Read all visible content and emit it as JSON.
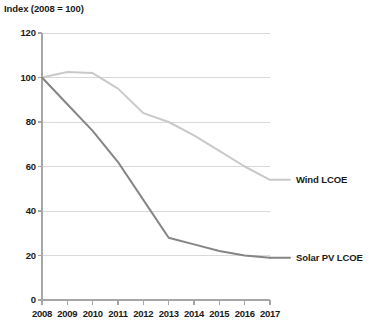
{
  "chart_data": {
    "type": "line",
    "title": "Index (2008 = 100)",
    "xlabel": "",
    "ylabel": "Index (2008 = 100)",
    "x": [
      2008,
      2009,
      2010,
      2011,
      2012,
      2013,
      2014,
      2015,
      2016,
      2017
    ],
    "xtick_labels": [
      "2008",
      "2009",
      "2010",
      "2011",
      "2012",
      "2013",
      "2014",
      "2015",
      "2016",
      "2017"
    ],
    "ytick_labels": [
      "0",
      "20",
      "40",
      "60",
      "80",
      "100",
      "120"
    ],
    "yticks": [
      0,
      20,
      40,
      60,
      80,
      100,
      120
    ],
    "ylim": [
      0,
      120
    ],
    "xlim": [
      2008,
      2017
    ],
    "grid": "horizontal",
    "legend_position": "inline-right-of-line-end",
    "series": [
      {
        "name": "Wind LCOE",
        "color": "#c9c9c9",
        "values": [
          100,
          102.5,
          102,
          95,
          84,
          80,
          74,
          67,
          60,
          54
        ],
        "label_x": 2017,
        "label_y": 54
      },
      {
        "name": "Solar PV LCOE",
        "color": "#858585",
        "values": [
          100,
          88,
          76,
          62,
          45,
          28,
          25,
          22,
          20,
          19
        ],
        "label_x": 2017,
        "label_y": 19
      }
    ]
  },
  "axis": {
    "gridline_color": "#d9d9d9",
    "axis_color": "#a6a6a6"
  }
}
